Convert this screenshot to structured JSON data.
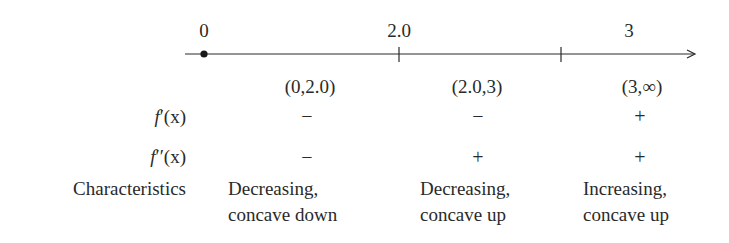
{
  "number_line": {
    "labels": [
      {
        "text": "0",
        "x": 204
      },
      {
        "text": "2.0",
        "x": 399
      },
      {
        "text": "3",
        "x": 629
      }
    ],
    "critical_point_dot_x": 204,
    "tick_marks_x": [
      399,
      561
    ],
    "line_color": "#2a2a2a"
  },
  "table": {
    "intervals": [
      "(0,2.0)",
      "(2.0,3)",
      "(3,∞)"
    ],
    "rows": [
      {
        "label_fn": "f",
        "label_primes": "′",
        "label_arg": "(x)",
        "values": [
          "−",
          "−",
          "+"
        ]
      },
      {
        "label_fn": "f",
        "label_primes": "′′",
        "label_arg": "(x)",
        "values": [
          "−",
          "+",
          "+"
        ]
      }
    ],
    "characteristics_label": "Characteristics",
    "characteristics": [
      {
        "line1": "Decreasing,",
        "line2": "concave down"
      },
      {
        "line1": "Decreasing,",
        "line2": "concave up"
      },
      {
        "line1": "Increasing,",
        "line2": "concave up"
      }
    ]
  }
}
